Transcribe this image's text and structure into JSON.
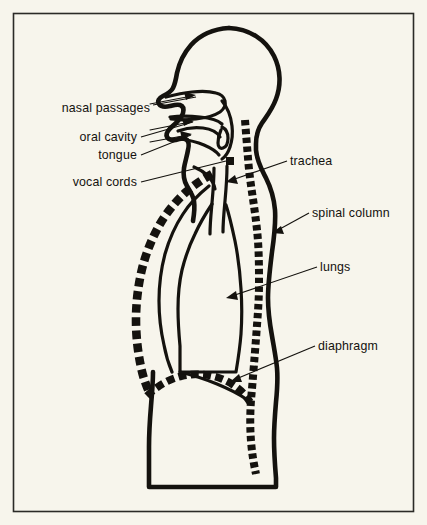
{
  "figure": {
    "background_color": "#f7f5ec",
    "ink_color": "#14120e",
    "frame_color": "#2b2a26"
  },
  "labels": {
    "nasal_passages": "nasal passages",
    "oral_cavity": "oral cavity",
    "tongue": "tongue",
    "vocal_cords": "vocal cords",
    "trachea": "trachea",
    "spinal_column": "spinal column",
    "lungs": "lungs",
    "diaphragm": "diaphragm"
  },
  "parts": [
    {
      "name": "nasal passages",
      "side": "left",
      "label_x": 150,
      "label_y": 108
    },
    {
      "name": "oral cavity",
      "side": "left",
      "label_x": 137,
      "label_y": 141
    },
    {
      "name": "tongue",
      "side": "left",
      "label_x": 137,
      "label_y": 159
    },
    {
      "name": "vocal cords",
      "side": "left",
      "label_x": 137,
      "label_y": 186
    },
    {
      "name": "trachea",
      "side": "right",
      "label_x": 290,
      "label_y": 164
    },
    {
      "name": "spinal column",
      "side": "right",
      "label_x": 312,
      "label_y": 216
    },
    {
      "name": "lungs",
      "side": "right",
      "label_x": 320,
      "label_y": 269
    },
    {
      "name": "diaphragm",
      "side": "right",
      "label_x": 318,
      "label_y": 349
    }
  ],
  "airflow_arrows": [
    {
      "name": "nasal-inflow",
      "region": "nasal passage"
    },
    {
      "name": "oral-inflow",
      "region": "oral cavity"
    },
    {
      "name": "pharynx-inflow",
      "region": "pharynx"
    }
  ]
}
